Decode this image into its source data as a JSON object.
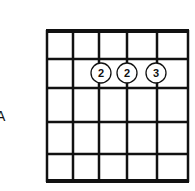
{
  "diagram": {
    "type": "guitar-chord-diagram",
    "chord_name": "A",
    "strings": 6,
    "frets": 5,
    "string_x": [
      47,
      73,
      99,
      127,
      157,
      188
    ],
    "fret_y": [
      31,
      59,
      88,
      122,
      154,
      181
    ],
    "fingers": [
      {
        "string": 3,
        "fret": 1,
        "label": "2"
      },
      {
        "string": 4,
        "fret": 1,
        "label": "2"
      },
      {
        "string": 5,
        "fret": 1,
        "label": "3"
      }
    ],
    "colors": {
      "line": "#111111",
      "background": "#ffffff",
      "circle_fill": "#ffffff"
    }
  }
}
